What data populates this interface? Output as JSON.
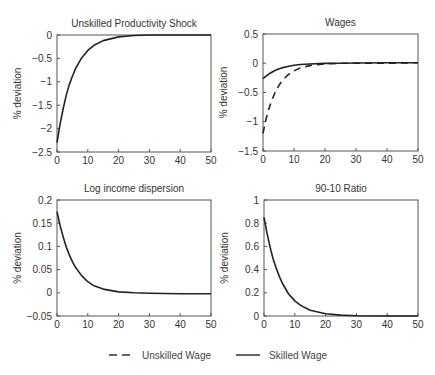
{
  "chart_data": [
    {
      "type": "line",
      "title": "Unskilled Productivity Shock",
      "xlabel": "",
      "ylabel": "% deviation",
      "xlim": [
        0,
        50
      ],
      "ylim": [
        -2.5,
        0
      ],
      "xticks": [
        0,
        10,
        20,
        30,
        40,
        50
      ],
      "yticks": [
        0,
        -0.5,
        -1,
        -1.5,
        -2,
        -2.5
      ],
      "ytick_labels": [
        "0",
        "−0.5",
        "−1",
        "−1.5",
        "−2",
        "−2.5"
      ],
      "grid": false,
      "box": {
        "left": 57,
        "top": 35,
        "right": 211,
        "bottom": 152
      },
      "series": [
        {
          "name": "Shock",
          "style": "solid",
          "x": [
            0,
            1,
            2,
            3,
            4,
            5,
            6,
            8,
            10,
            12,
            15,
            20,
            25,
            30,
            40,
            50
          ],
          "values": [
            -2.3,
            -1.9,
            -1.57,
            -1.29,
            -1.06,
            -0.88,
            -0.72,
            -0.49,
            -0.33,
            -0.22,
            -0.12,
            -0.04,
            -0.01,
            0,
            0,
            0
          ]
        }
      ]
    },
    {
      "type": "line",
      "title": "Wages",
      "xlabel": "",
      "ylabel": "% deviation",
      "xlim": [
        0,
        50
      ],
      "ylim": [
        -1.5,
        0.5
      ],
      "xticks": [
        0,
        10,
        20,
        30,
        40,
        50
      ],
      "yticks": [
        0.5,
        0,
        -0.5,
        -1,
        -1.5
      ],
      "ytick_labels": [
        "0.5",
        "0",
        "−0.5",
        "−1",
        "−1.5"
      ],
      "grid": false,
      "box": {
        "left": 263,
        "top": 34,
        "right": 418,
        "bottom": 151
      },
      "series": [
        {
          "name": "Unskilled Wage",
          "style": "dashed",
          "x": [
            0,
            1,
            2,
            3,
            4,
            5,
            6,
            8,
            10,
            12,
            15,
            20,
            25,
            30,
            40,
            50
          ],
          "values": [
            -1.2,
            -0.95,
            -0.76,
            -0.61,
            -0.49,
            -0.39,
            -0.31,
            -0.2,
            -0.13,
            -0.08,
            -0.04,
            -0.01,
            0,
            0,
            0,
            0.01
          ]
        },
        {
          "name": "Skilled Wage",
          "style": "solid",
          "x": [
            0,
            1,
            2,
            3,
            4,
            5,
            6,
            8,
            10,
            12,
            15,
            20,
            25,
            30,
            40,
            50
          ],
          "values": [
            -0.26,
            -0.22,
            -0.18,
            -0.15,
            -0.12,
            -0.1,
            -0.08,
            -0.055,
            -0.035,
            -0.022,
            -0.012,
            -0.003,
            0,
            0.005,
            0.01,
            0.01
          ]
        }
      ]
    },
    {
      "type": "line",
      "title": "Log income dispersion",
      "xlabel": "",
      "ylabel": "% deviation",
      "xlim": [
        0,
        50
      ],
      "ylim": [
        -0.05,
        0.2
      ],
      "xticks": [
        0,
        10,
        20,
        30,
        40,
        50
      ],
      "yticks": [
        0.2,
        0.15,
        0.1,
        0.05,
        0,
        -0.05
      ],
      "ytick_labels": [
        "0.2",
        "0.15",
        "0.1",
        "0.05",
        "0",
        "−0.05"
      ],
      "grid": false,
      "box": {
        "left": 57,
        "top": 200,
        "right": 211,
        "bottom": 316
      },
      "series": [
        {
          "name": "Dispersion",
          "style": "solid",
          "x": [
            0,
            1,
            2,
            3,
            4,
            5,
            6,
            8,
            10,
            12,
            15,
            20,
            25,
            30,
            40,
            50
          ],
          "values": [
            0.175,
            0.145,
            0.12,
            0.099,
            0.082,
            0.067,
            0.055,
            0.037,
            0.024,
            0.015,
            0.008,
            0.002,
            0,
            -0.001,
            -0.002,
            -0.002
          ]
        }
      ]
    },
    {
      "type": "line",
      "title": "90-10 Ratio",
      "xlabel": "",
      "ylabel": "% deviation",
      "xlim": [
        0,
        50
      ],
      "ylim": [
        0,
        1
      ],
      "xticks": [
        0,
        10,
        20,
        30,
        40,
        50
      ],
      "yticks": [
        1,
        0.8,
        0.6,
        0.4,
        0.2,
        0
      ],
      "ytick_labels": [
        "1",
        "0.8",
        "0.6",
        "0.4",
        "0.2",
        "0"
      ],
      "grid": false,
      "box": {
        "left": 264,
        "top": 200,
        "right": 418,
        "bottom": 316
      },
      "series": [
        {
          "name": "90-10 Ratio",
          "style": "solid",
          "x": [
            0,
            1,
            2,
            3,
            4,
            5,
            6,
            8,
            10,
            12,
            15,
            20,
            25,
            30,
            40,
            50
          ],
          "values": [
            0.85,
            0.71,
            0.59,
            0.49,
            0.41,
            0.34,
            0.28,
            0.19,
            0.13,
            0.09,
            0.05,
            0.02,
            0.008,
            0.003,
            0,
            0
          ]
        }
      ]
    }
  ],
  "legend": {
    "items": [
      {
        "label": "Unskilled Wage",
        "style": "dashed"
      },
      {
        "label": "Skilled Wage",
        "style": "solid"
      }
    ]
  },
  "colors": {
    "line": "#222222",
    "axis": "#555555",
    "text": "#333333"
  }
}
